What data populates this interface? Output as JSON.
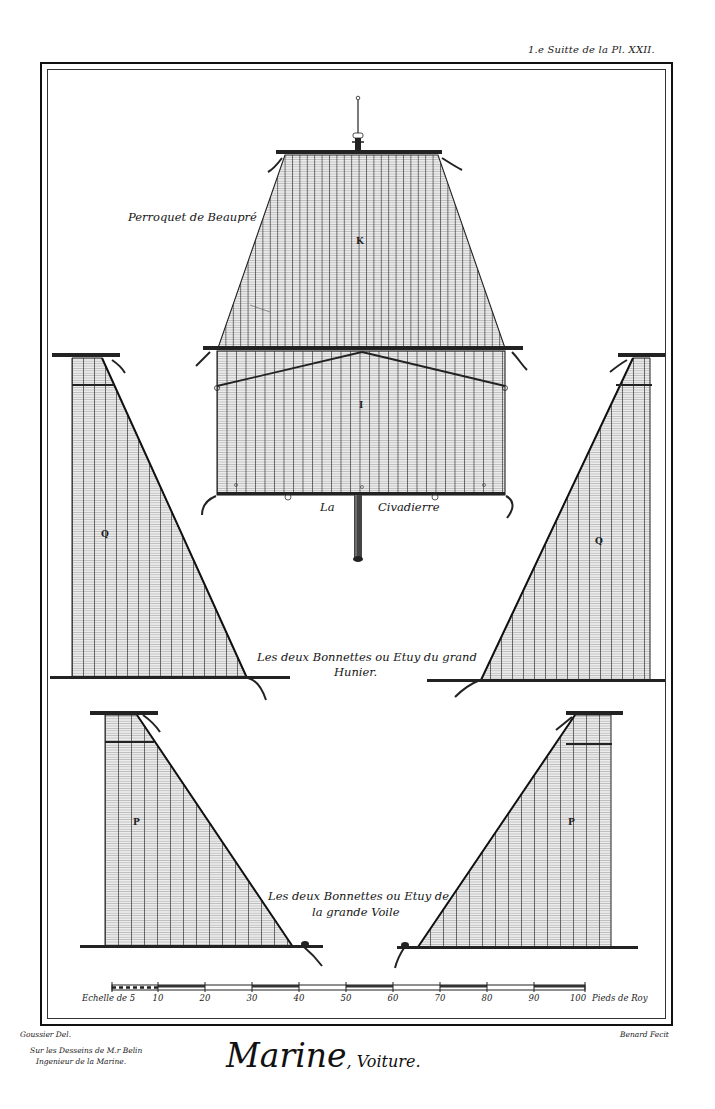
{
  "plate": {
    "reference": "1.e Suitte de la Pl. XXII.",
    "title_main": "Marine",
    "title_sub": ", Voiture."
  },
  "figures": {
    "perroquet": {
      "caption": "Perroquet de Beaupré",
      "letter": "K"
    },
    "civadiere": {
      "caption_left": "La",
      "caption_right": "Civadierre",
      "letter": "I"
    },
    "bonnettes_hunier": {
      "caption_line1": "Les deux Bonnettes ou Etuy du grand",
      "caption_line2": "Hunier.",
      "letter": "Q"
    },
    "bonnettes_voile": {
      "caption_line1": "Les deux Bonnettes ou Etuy de",
      "caption_line2": "la grande Voile",
      "letter": "P"
    }
  },
  "scale": {
    "label": "Echelle de 5",
    "unit": "Pieds de Roy",
    "ticks": [
      "10",
      "20",
      "30",
      "40",
      "50",
      "60",
      "70",
      "80",
      "90",
      "100"
    ]
  },
  "credits": {
    "draughtsman": "Goussier Del.",
    "after_line1": "Sur les Desseins de M.r Belin",
    "after_line2": "Ingenieur de la Marine.",
    "engraver": "Benard Fecit"
  },
  "colors": {
    "ink": "#111111",
    "paper": "#ffffff",
    "sail_fill": "#e6e6e6"
  }
}
